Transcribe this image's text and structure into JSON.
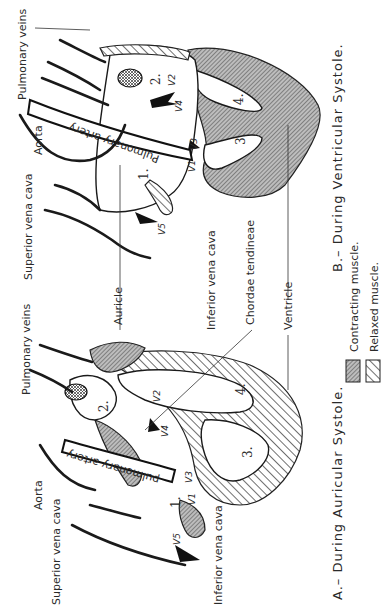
{
  "orientation": "rotated-90-ccw",
  "panels": {
    "a": {
      "caption": "A.– During Auricular Systole.",
      "labels": {
        "pulmonary_veins": "Pulmonary veins",
        "aorta": "Aorta",
        "superior_vena_cava": "Superior vena cava",
        "inferior_vena_cava": "Inferior vena cava",
        "pulmonary_artery": "pulmonary artery",
        "auricle": "Auricle",
        "chordae_tendineae": "Chordae tendineae",
        "ventricle": "Ventricle"
      },
      "chambers": [
        "1.",
        "2.",
        "3.",
        "4."
      ],
      "valves": [
        "V1",
        "V2",
        "V3",
        "V4",
        "V5"
      ]
    },
    "b": {
      "caption": "B.– During Ventricular Systole.",
      "labels": {
        "pulmonary_veins": "Pulmonary veins",
        "aorta": "Aorta",
        "superior_vena_cava": "Superior vena cava",
        "inferior_vena_cava": "Inferior vena cava",
        "pulmonary_artery": "Pulmonary artery"
      },
      "chambers": [
        "1.",
        "2.",
        "3.",
        "4."
      ],
      "valves": [
        "V1",
        "V2",
        "V3",
        "V4",
        "V5"
      ]
    }
  },
  "legend": {
    "contracting": "Contracting muscle.",
    "relaxed": "Relaxed muscle."
  },
  "colors": {
    "ink": "#1a1a1a",
    "contracting_fill": "#8c8c8c",
    "paper": "#ffffff"
  }
}
